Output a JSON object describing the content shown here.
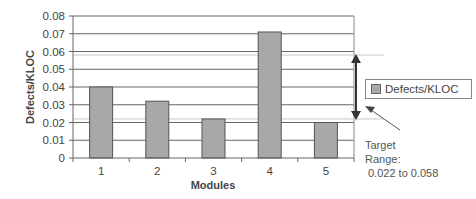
{
  "chart_data": {
    "type": "bar",
    "title": "",
    "xlabel": "Modules",
    "ylabel": "Defects/KLOC",
    "categories": [
      "1",
      "2",
      "3",
      "4",
      "5"
    ],
    "series": [
      {
        "name": "Defects/KLOC",
        "values": [
          0.04,
          0.032,
          0.022,
          0.071,
          0.02
        ],
        "color": "#a8a8a8"
      }
    ],
    "ylim": [
      0,
      0.08
    ],
    "yticks": [
      "0",
      "0.01",
      "0.02",
      "0.03",
      "0.04",
      "0.05",
      "0.06",
      "0.07",
      "0.08"
    ],
    "grid": true,
    "legend_position": "right",
    "target_range": {
      "low": 0.022,
      "high": 0.058
    },
    "annotation": {
      "line1": "Target",
      "line2": "Range:",
      "line3": "0.022 to 0.058"
    }
  },
  "legend": {
    "label": "Defects/KLOC"
  }
}
